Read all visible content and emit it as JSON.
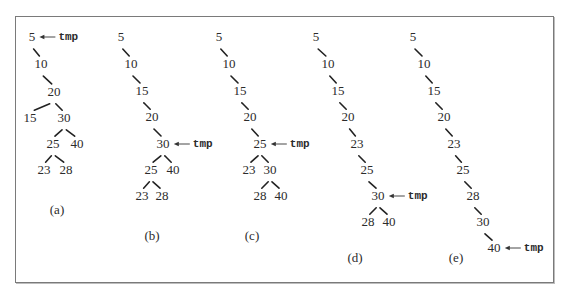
{
  "figure": {
    "pointer_label": "tmp",
    "panels": [
      {
        "id": "a",
        "caption": "(a)",
        "caption_pos": [
          57,
          214
        ],
        "nodes": [
          {
            "id": "n5",
            "label": "5",
            "x": 32,
            "y": 41
          },
          {
            "id": "n10",
            "label": "10",
            "x": 41,
            "y": 68
          },
          {
            "id": "n20",
            "label": "20",
            "x": 54,
            "y": 96
          },
          {
            "id": "n15",
            "label": "15",
            "x": 30,
            "y": 122
          },
          {
            "id": "n30",
            "label": "30",
            "x": 64,
            "y": 122
          },
          {
            "id": "n25",
            "label": "25",
            "x": 53,
            "y": 148
          },
          {
            "id": "n40",
            "label": "40",
            "x": 77,
            "y": 148
          },
          {
            "id": "n23",
            "label": "23",
            "x": 44,
            "y": 174
          },
          {
            "id": "n28",
            "label": "28",
            "x": 66,
            "y": 174
          }
        ],
        "edges": [
          [
            "n5",
            "n10"
          ],
          [
            "n10",
            "n20"
          ],
          [
            "n20",
            "n15"
          ],
          [
            "n20",
            "n30"
          ],
          [
            "n30",
            "n25"
          ],
          [
            "n30",
            "n40"
          ],
          [
            "n25",
            "n23"
          ],
          [
            "n25",
            "n28"
          ]
        ],
        "tmp_at": "n5"
      },
      {
        "id": "b",
        "caption": "(b)",
        "caption_pos": [
          152,
          240
        ],
        "nodes": [
          {
            "id": "n5",
            "label": "5",
            "x": 121,
            "y": 41
          },
          {
            "id": "n10",
            "label": "10",
            "x": 131,
            "y": 68
          },
          {
            "id": "n15",
            "label": "15",
            "x": 142,
            "y": 95
          },
          {
            "id": "n20",
            "label": "20",
            "x": 152,
            "y": 121
          },
          {
            "id": "n30",
            "label": "30",
            "x": 163,
            "y": 148
          },
          {
            "id": "n25",
            "label": "25",
            "x": 151,
            "y": 174
          },
          {
            "id": "n40",
            "label": "40",
            "x": 173,
            "y": 174
          },
          {
            "id": "n23",
            "label": "23",
            "x": 142,
            "y": 200
          },
          {
            "id": "n28",
            "label": "28",
            "x": 162,
            "y": 200
          }
        ],
        "edges": [
          [
            "n5",
            "n10"
          ],
          [
            "n10",
            "n15"
          ],
          [
            "n15",
            "n20"
          ],
          [
            "n20",
            "n30"
          ],
          [
            "n30",
            "n25"
          ],
          [
            "n30",
            "n40"
          ],
          [
            "n25",
            "n23"
          ],
          [
            "n25",
            "n28"
          ]
        ],
        "tmp_at": "n30"
      },
      {
        "id": "c",
        "caption": "(c)",
        "caption_pos": [
          252,
          240
        ],
        "nodes": [
          {
            "id": "n5",
            "label": "5",
            "x": 219,
            "y": 41
          },
          {
            "id": "n10",
            "label": "10",
            "x": 229,
            "y": 68
          },
          {
            "id": "n15",
            "label": "15",
            "x": 240,
            "y": 95
          },
          {
            "id": "n20",
            "label": "20",
            "x": 250,
            "y": 121
          },
          {
            "id": "n25",
            "label": "25",
            "x": 260,
            "y": 148
          },
          {
            "id": "n23",
            "label": "23",
            "x": 249,
            "y": 174
          },
          {
            "id": "n30",
            "label": "30",
            "x": 270,
            "y": 174
          },
          {
            "id": "n28",
            "label": "28",
            "x": 260,
            "y": 200
          },
          {
            "id": "n40",
            "label": "40",
            "x": 281,
            "y": 200
          }
        ],
        "edges": [
          [
            "n5",
            "n10"
          ],
          [
            "n10",
            "n15"
          ],
          [
            "n15",
            "n20"
          ],
          [
            "n20",
            "n25"
          ],
          [
            "n25",
            "n23"
          ],
          [
            "n25",
            "n30"
          ],
          [
            "n30",
            "n28"
          ],
          [
            "n30",
            "n40"
          ]
        ],
        "tmp_at": "n25"
      },
      {
        "id": "d",
        "caption": "(d)",
        "caption_pos": [
          355,
          262
        ],
        "nodes": [
          {
            "id": "n5",
            "label": "5",
            "x": 316,
            "y": 41
          },
          {
            "id": "n10",
            "label": "10",
            "x": 328,
            "y": 68
          },
          {
            "id": "n15",
            "label": "15",
            "x": 338,
            "y": 95
          },
          {
            "id": "n20",
            "label": "20",
            "x": 348,
            "y": 121
          },
          {
            "id": "n23",
            "label": "23",
            "x": 357,
            "y": 148
          },
          {
            "id": "n25",
            "label": "25",
            "x": 367,
            "y": 174
          },
          {
            "id": "n30",
            "label": "30",
            "x": 378,
            "y": 200
          },
          {
            "id": "n28",
            "label": "28",
            "x": 368,
            "y": 226
          },
          {
            "id": "n40",
            "label": "40",
            "x": 389,
            "y": 226
          }
        ],
        "edges": [
          [
            "n5",
            "n10"
          ],
          [
            "n10",
            "n15"
          ],
          [
            "n15",
            "n20"
          ],
          [
            "n20",
            "n23"
          ],
          [
            "n23",
            "n25"
          ],
          [
            "n25",
            "n30"
          ],
          [
            "n30",
            "n28"
          ],
          [
            "n30",
            "n40"
          ]
        ],
        "tmp_at": "n30"
      },
      {
        "id": "e",
        "caption": "(e)",
        "caption_pos": [
          456,
          262
        ],
        "nodes": [
          {
            "id": "n5",
            "label": "5",
            "x": 413,
            "y": 41
          },
          {
            "id": "n10",
            "label": "10",
            "x": 424,
            "y": 68
          },
          {
            "id": "n15",
            "label": "15",
            "x": 434,
            "y": 95
          },
          {
            "id": "n20",
            "label": "20",
            "x": 444,
            "y": 121
          },
          {
            "id": "n23",
            "label": "23",
            "x": 454,
            "y": 148
          },
          {
            "id": "n25",
            "label": "25",
            "x": 463,
            "y": 174
          },
          {
            "id": "n28",
            "label": "28",
            "x": 473,
            "y": 200
          },
          {
            "id": "n30",
            "label": "30",
            "x": 483,
            "y": 226
          },
          {
            "id": "n40",
            "label": "40",
            "x": 494,
            "y": 252
          }
        ],
        "edges": [
          [
            "n5",
            "n10"
          ],
          [
            "n10",
            "n15"
          ],
          [
            "n15",
            "n20"
          ],
          [
            "n20",
            "n23"
          ],
          [
            "n23",
            "n25"
          ],
          [
            "n25",
            "n28"
          ],
          [
            "n28",
            "n30"
          ],
          [
            "n30",
            "n40"
          ]
        ],
        "tmp_at": "n40"
      }
    ]
  }
}
